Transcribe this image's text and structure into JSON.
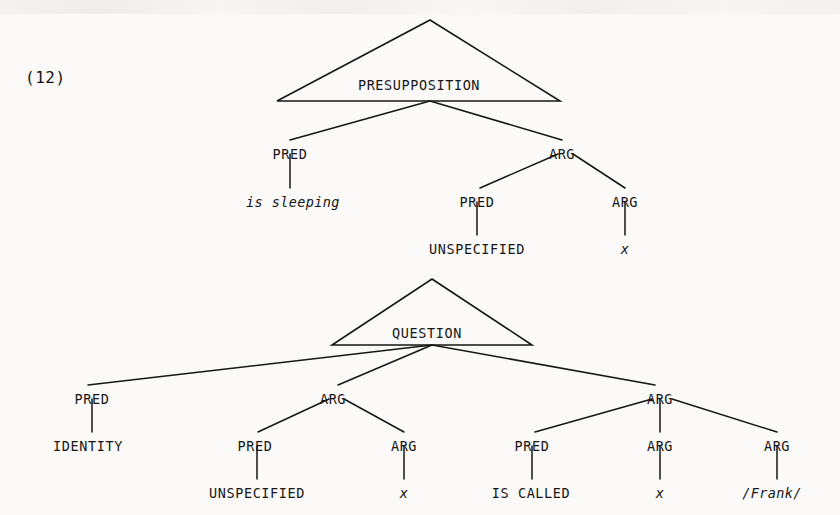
{
  "page": {
    "example_number": "(12)",
    "background_color": "#fbfaf8",
    "ink_color": "#161616",
    "width": 840,
    "height": 515
  },
  "trees": [
    {
      "id": "presupposition-tree",
      "root": {
        "label": "PRESUPPOSITION",
        "shape": "triangle",
        "apex": {
          "x": 430,
          "y": 20
        },
        "base_left": {
          "x": 277,
          "y": 101
        },
        "base_right": {
          "x": 560,
          "y": 101
        },
        "text_x": 419,
        "text_y": 79
      },
      "nodes": [
        {
          "name": "pred-1",
          "label": "PRED",
          "x": 290,
          "y": 148,
          "style": "roman"
        },
        {
          "name": "arg-1",
          "label": "ARG",
          "x": 562,
          "y": 148,
          "style": "roman"
        },
        {
          "name": "is-sleeping",
          "label": "is sleeping",
          "x": 293,
          "y": 196,
          "style": "italic"
        },
        {
          "name": "pred-2",
          "label": "PRED",
          "x": 477,
          "y": 196,
          "style": "roman"
        },
        {
          "name": "arg-2",
          "label": "ARG",
          "x": 625,
          "y": 196,
          "style": "roman"
        },
        {
          "name": "unspecified-1",
          "label": "UNSPECIFIED",
          "x": 477,
          "y": 243,
          "style": "roman"
        },
        {
          "name": "variable-x-1",
          "label": "x",
          "x": 625,
          "y": 243,
          "style": "italic"
        }
      ],
      "edges": [
        {
          "from": "triangle-base-center",
          "to": "pred-1",
          "x1": 430,
          "y1": 101,
          "x2": 290,
          "y2": 140
        },
        {
          "from": "triangle-base-center",
          "to": "arg-1",
          "x1": 430,
          "y1": 101,
          "x2": 562,
          "y2": 140
        },
        {
          "from": "pred-1",
          "to": "is-sleeping",
          "x1": 290,
          "y1": 154,
          "x2": 290,
          "y2": 188
        },
        {
          "from": "arg-1",
          "to": "pred-2",
          "x1": 558,
          "y1": 154,
          "x2": 480,
          "y2": 188
        },
        {
          "from": "arg-1",
          "to": "arg-2",
          "x1": 573,
          "y1": 154,
          "x2": 625,
          "y2": 188
        },
        {
          "from": "pred-2",
          "to": "unspecified-1",
          "x1": 477,
          "y1": 202,
          "x2": 477,
          "y2": 235
        },
        {
          "from": "arg-2",
          "to": "variable-x-1",
          "x1": 625,
          "y1": 202,
          "x2": 625,
          "y2": 235
        }
      ]
    },
    {
      "id": "question-tree",
      "root": {
        "label": "QUESTION",
        "shape": "triangle",
        "apex": {
          "x": 432,
          "y": 279
        },
        "base_left": {
          "x": 332,
          "y": 345
        },
        "base_right": {
          "x": 532,
          "y": 345
        },
        "text_x": 427,
        "text_y": 327
      },
      "nodes": [
        {
          "name": "pred-3",
          "label": "PRED",
          "x": 92,
          "y": 393,
          "style": "roman"
        },
        {
          "name": "arg-3",
          "label": "ARG",
          "x": 333,
          "y": 393,
          "style": "roman"
        },
        {
          "name": "arg-4",
          "label": "ARG",
          "x": 660,
          "y": 393,
          "style": "roman"
        },
        {
          "name": "identity",
          "label": "IDENTITY",
          "x": 88,
          "y": 440,
          "style": "roman"
        },
        {
          "name": "pred-4",
          "label": "PRED",
          "x": 255,
          "y": 440,
          "style": "roman"
        },
        {
          "name": "arg-5",
          "label": "ARG",
          "x": 404,
          "y": 440,
          "style": "roman"
        },
        {
          "name": "pred-5",
          "label": "PRED",
          "x": 532,
          "y": 440,
          "style": "roman"
        },
        {
          "name": "arg-6",
          "label": "ARG",
          "x": 660,
          "y": 440,
          "style": "roman"
        },
        {
          "name": "arg-7",
          "label": "ARG",
          "x": 777,
          "y": 440,
          "style": "roman"
        },
        {
          "name": "unspecified-2",
          "label": "UNSPECIFIED",
          "x": 257,
          "y": 487,
          "style": "roman"
        },
        {
          "name": "variable-x-2",
          "label": "x",
          "x": 404,
          "y": 487,
          "style": "italic"
        },
        {
          "name": "is-called",
          "label": "IS CALLED",
          "x": 531,
          "y": 487,
          "style": "roman"
        },
        {
          "name": "variable-x-3",
          "label": "x",
          "x": 660,
          "y": 487,
          "style": "italic"
        },
        {
          "name": "frank",
          "label": "/Frank/",
          "x": 772,
          "y": 487,
          "style": "italic"
        }
      ],
      "edges": [
        {
          "from": "triangle-base-center",
          "to": "pred-3",
          "x1": 432,
          "y1": 345,
          "x2": 88,
          "y2": 385
        },
        {
          "from": "triangle-base-center",
          "to": "arg-3",
          "x1": 432,
          "y1": 345,
          "x2": 338,
          "y2": 385
        },
        {
          "from": "triangle-base-center",
          "to": "arg-4",
          "x1": 432,
          "y1": 345,
          "x2": 655,
          "y2": 385
        },
        {
          "from": "pred-3",
          "to": "identity",
          "x1": 92,
          "y1": 399,
          "x2": 92,
          "y2": 432
        },
        {
          "from": "arg-3",
          "to": "pred-4",
          "x1": 329,
          "y1": 399,
          "x2": 258,
          "y2": 432
        },
        {
          "from": "arg-3",
          "to": "arg-5",
          "x1": 344,
          "y1": 399,
          "x2": 404,
          "y2": 432
        },
        {
          "from": "arg-4",
          "to": "pred-5",
          "x1": 652,
          "y1": 399,
          "x2": 535,
          "y2": 432
        },
        {
          "from": "arg-4",
          "to": "arg-6",
          "x1": 660,
          "y1": 399,
          "x2": 660,
          "y2": 432
        },
        {
          "from": "arg-4",
          "to": "arg-7",
          "x1": 672,
          "y1": 399,
          "x2": 777,
          "y2": 432
        },
        {
          "from": "pred-4",
          "to": "unspecified-2",
          "x1": 257,
          "y1": 446,
          "x2": 257,
          "y2": 479
        },
        {
          "from": "arg-5",
          "to": "variable-x-2",
          "x1": 404,
          "y1": 446,
          "x2": 404,
          "y2": 479
        },
        {
          "from": "pred-5",
          "to": "is-called",
          "x1": 532,
          "y1": 446,
          "x2": 532,
          "y2": 479
        },
        {
          "from": "arg-6",
          "to": "variable-x-3",
          "x1": 660,
          "y1": 446,
          "x2": 660,
          "y2": 479
        },
        {
          "from": "arg-7",
          "to": "frank",
          "x1": 777,
          "y1": 446,
          "x2": 777,
          "y2": 479
        }
      ]
    }
  ]
}
